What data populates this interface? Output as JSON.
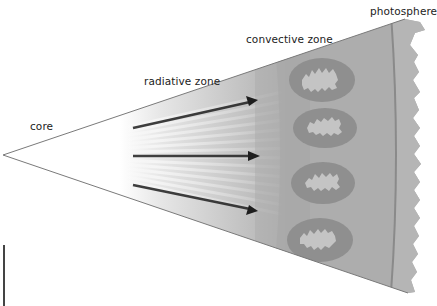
{
  "labels": {
    "core": "core",
    "radiative_zone": "radiative zone",
    "convective_zone": "convective zone",
    "photosphere": "photosphere"
  },
  "elements": {
    "arrows": [
      {
        "name": "energy-arrow-top",
        "from": [
          133,
          128
        ],
        "to": [
          257,
          100
        ]
      },
      {
        "name": "energy-arrow-middle",
        "from": [
          133,
          156
        ],
        "to": [
          259,
          156
        ]
      },
      {
        "name": "energy-arrow-bottom",
        "from": [
          133,
          185
        ],
        "to": [
          257,
          211
        ]
      }
    ],
    "convection_cells": [
      {
        "cx": 322,
        "cy": 80
      },
      {
        "cx": 325,
        "cy": 128
      },
      {
        "cx": 323,
        "cy": 183
      },
      {
        "cx": 320,
        "cy": 240
      }
    ]
  },
  "colors": {
    "outline": "#7a7a7a",
    "convective_fill": "#a9a9a9",
    "cell_ring": "#8f8f8f",
    "cell_center": "#c4c4c4",
    "photosphere_fill": "#b3b3b3",
    "arrow": "#1e1e1e"
  }
}
